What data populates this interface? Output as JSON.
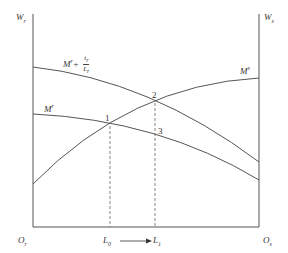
{
  "diagram": {
    "type": "economics-two-sector-labor-allocation",
    "axes": {
      "left_axis_label": "W",
      "left_axis_sub": "r",
      "right_axis_label": "W",
      "right_axis_sub": "s",
      "left_origin_label": "O",
      "left_origin_sub": "r",
      "right_origin_label": "O",
      "right_origin_sub": "s"
    },
    "curves": [
      {
        "id": "m-prime-plus",
        "label_main": "M",
        "label_sup": "r",
        "label_plus": "+",
        "frac_num": "t",
        "frac_num_sub": "r",
        "frac_den": "L",
        "frac_den_sub": "r"
      },
      {
        "id": "m-prime",
        "label_main": "M",
        "label_sup": "r"
      },
      {
        "id": "m-star",
        "label_main": "M",
        "label_sup": "s"
      }
    ],
    "points": [
      {
        "id": "1",
        "label": "1"
      },
      {
        "id": "2",
        "label": "2"
      },
      {
        "id": "3",
        "label": "3"
      }
    ],
    "x_markers": {
      "l0_label": "L",
      "l0_sub": "0",
      "l1_label": "L",
      "l1_sub": "1"
    },
    "colors": {
      "line": "#555555",
      "text": "#333333",
      "background": "#ffffff"
    }
  }
}
